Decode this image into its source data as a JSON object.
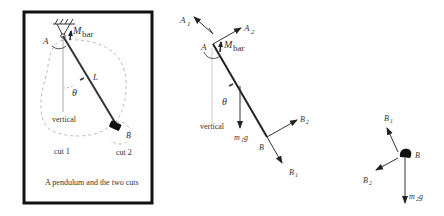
{
  "panel1": {
    "caption": "A pendulum and the two cuts",
    "labels": {
      "A": "A",
      "M": "M",
      "M_sub": "bar",
      "L": "L",
      "theta": "θ",
      "vertical": "vertical",
      "B": "B",
      "cut1": "cut 1",
      "cut2": "cut 2"
    }
  },
  "panel2": {
    "labels": {
      "A1": "A",
      "A1_sub": "1",
      "A2": "A",
      "A2_sub": "2",
      "A": "A",
      "M": "M",
      "M_sub": "bar",
      "theta": "θ",
      "vertical": "vertical",
      "m1g": "m",
      "m1g_sub": "1",
      "m1g_g": "g",
      "B": "B",
      "B1": "B",
      "B1_sub": "1",
      "B2": "B",
      "B2_sub": "2"
    }
  },
  "panel3": {
    "labels": {
      "B1": "B",
      "B1_sub": "1",
      "B": "B",
      "B2": "B",
      "B2_sub": "2",
      "m2g": "m",
      "m2g_sub": "2",
      "m2g_g": "g"
    }
  }
}
